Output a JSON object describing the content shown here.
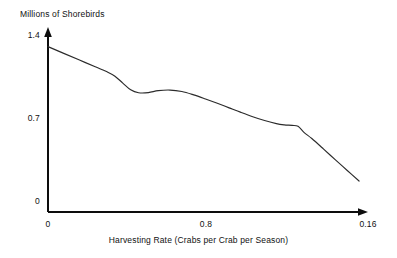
{
  "chart_data": {
    "type": "line",
    "title": "",
    "subtitle": "",
    "xlabel": "Harvesting Rate (Crabs per Crab per Season)",
    "ylabel": "Millions of Shorebirds",
    "grid": false,
    "legend": null,
    "legend_position": "none",
    "xlim": [
      0,
      0.16
    ],
    "ylim": [
      0,
      1.4
    ],
    "xticks": [
      "0",
      "0.8",
      "0.16"
    ],
    "xtick_values": [
      0,
      0.08,
      0.16
    ],
    "yticks": [
      "0",
      "0.7",
      "1.4"
    ],
    "ytick_values": [
      0,
      0.7,
      1.4
    ],
    "axis_style": "arrow-tipped-l-frame",
    "series": [
      {
        "name": "Shorebird population",
        "color": "#2b2b2b",
        "x": [
          0.0,
          0.008,
          0.016,
          0.024,
          0.03,
          0.034,
          0.038,
          0.042,
          0.046,
          0.051,
          0.056,
          0.062,
          0.068,
          0.074,
          0.08,
          0.086,
          0.092,
          0.098,
          0.104,
          0.11,
          0.116,
          0.12,
          0.124,
          0.127,
          0.13,
          0.134,
          0.14,
          0.146,
          0.152,
          0.158
        ],
        "y": [
          1.378,
          1.322,
          1.266,
          1.21,
          1.168,
          1.132,
          1.074,
          1.018,
          0.994,
          0.995,
          1.011,
          1.016,
          1.004,
          0.976,
          0.942,
          0.906,
          0.868,
          0.83,
          0.794,
          0.762,
          0.736,
          0.726,
          0.722,
          0.714,
          0.664,
          0.612,
          0.524,
          0.434,
          0.346,
          0.258
        ]
      }
    ],
    "annotations": []
  }
}
